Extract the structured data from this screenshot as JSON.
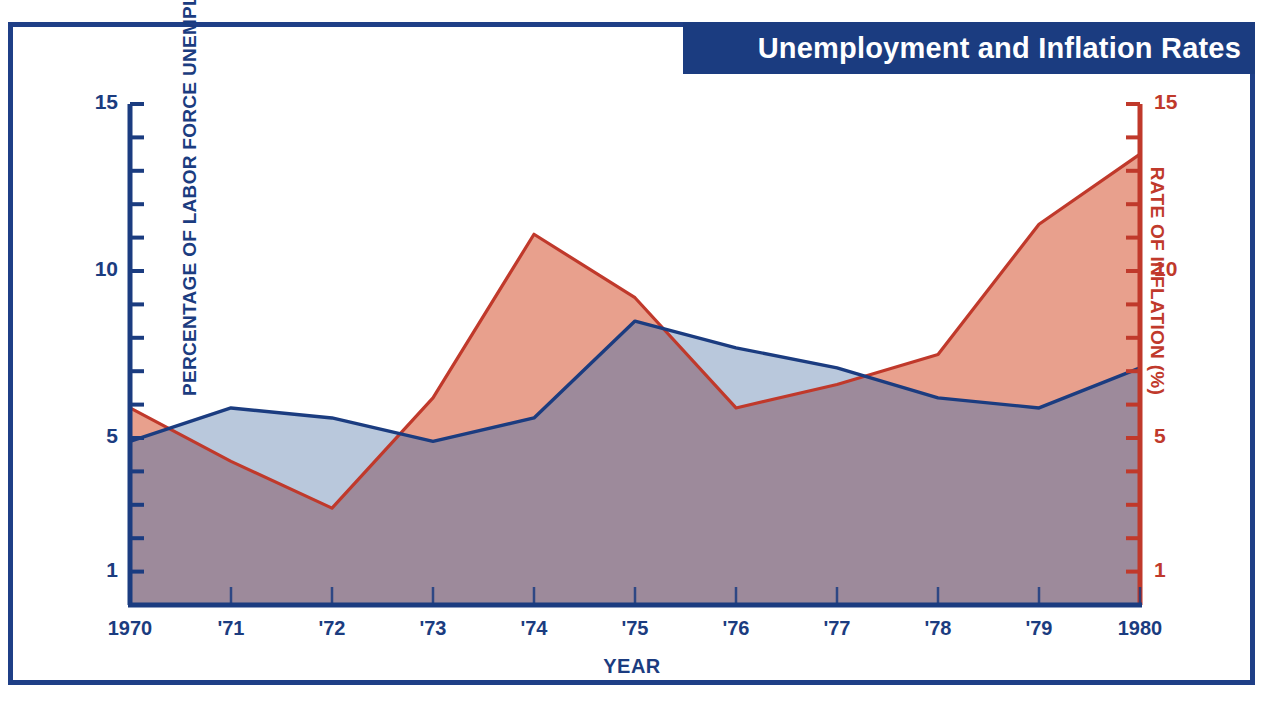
{
  "title": "Unemployment and Inflation Rates",
  "axes": {
    "x_label": "YEAR",
    "y_left_label": "PERCENTAGE OF LABOR FORCE UNEMPLOYED",
    "y_right_label": "RATE OF INFLATION (%)"
  },
  "colors": {
    "frame": "#1f3f87",
    "banner": "#1b3c80",
    "banner_text": "#ffffff",
    "unemployment_line": "#1b3c80",
    "unemployment_fill": "#b9c8dc",
    "inflation_line": "#c0392b",
    "inflation_fill": "#e8a08d",
    "overlap_fill": "#9d8a9b"
  },
  "ticks": {
    "left": [
      "15",
      "10",
      "5",
      "1"
    ],
    "right": [
      "15",
      "10",
      "5",
      "1"
    ],
    "x": [
      "1970",
      "'71",
      "'72",
      "'73",
      "'74",
      "'75",
      "'76",
      "'77",
      "'78",
      "'79",
      "1980"
    ]
  },
  "chart_data": {
    "type": "area",
    "title": "Unemployment and Inflation Rates",
    "xlabel": "YEAR",
    "ylabel": "PERCENTAGE OF LABOR FORCE UNEMPLOYED",
    "y2label": "RATE OF INFLATION (%)",
    "x": [
      1970,
      1971,
      1972,
      1973,
      1974,
      1975,
      1976,
      1977,
      1978,
      1979,
      1980
    ],
    "categories": [
      "1970",
      "'71",
      "'72",
      "'73",
      "'74",
      "'75",
      "'76",
      "'77",
      "'78",
      "'79",
      "1980"
    ],
    "ylim": [
      0,
      15
    ],
    "y2lim": [
      0,
      15
    ],
    "yticks": [
      1,
      5,
      10,
      15
    ],
    "y2ticks": [
      1,
      5,
      10,
      15
    ],
    "grid": false,
    "legend": "none",
    "series": [
      {
        "name": "PERCENTAGE OF LABOR FORCE UNEMPLOYED",
        "axis": "left",
        "color": "#1b3c80",
        "fill": "#b9c8dc",
        "values": [
          4.9,
          5.9,
          5.6,
          4.9,
          5.6,
          8.5,
          7.7,
          7.1,
          6.2,
          5.9,
          7.1
        ]
      },
      {
        "name": "RATE OF INFLATION (%)",
        "axis": "right",
        "color": "#c0392b",
        "fill": "#e8a08d",
        "values": [
          5.9,
          4.3,
          2.9,
          6.2,
          11.1,
          9.2,
          5.9,
          6.6,
          7.5,
          11.4,
          13.5
        ]
      }
    ]
  }
}
